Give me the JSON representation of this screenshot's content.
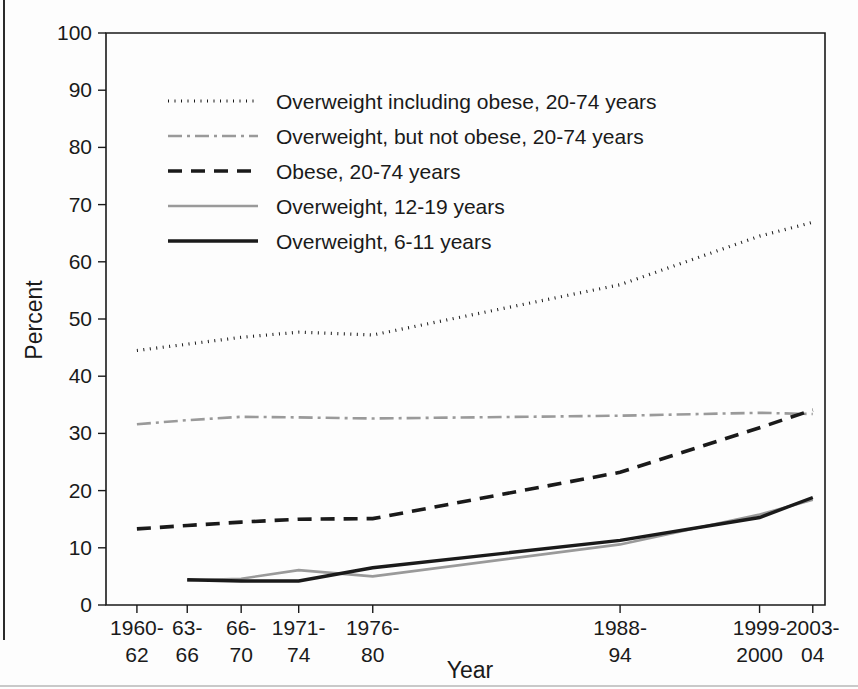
{
  "chart_data": {
    "type": "line",
    "title": "",
    "xlabel": "Year",
    "ylabel": "Percent",
    "ylim": [
      0,
      100
    ],
    "ytick_step": 10,
    "yticks": [
      0,
      10,
      20,
      30,
      40,
      50,
      60,
      70,
      80,
      90,
      100
    ],
    "grid": false,
    "legend_position": "upper-left-inside",
    "categories": [
      "1960-\n62",
      "63-\n66",
      "66-\n70",
      "1971-\n74",
      "1976-\n80",
      "1988-\n94",
      "1999-\n2000",
      "2003-\n04"
    ],
    "category_lines": [
      [
        "1960-",
        "62"
      ],
      [
        "63-",
        "66"
      ],
      [
        "66-",
        "70"
      ],
      [
        "1971-",
        "74"
      ],
      [
        "1976-",
        "80"
      ],
      [
        "1988-",
        "94"
      ],
      [
        "1999-",
        "2000"
      ],
      [
        "2003-",
        "04"
      ]
    ],
    "x_positions_fraction": [
      0.043,
      0.113,
      0.188,
      0.268,
      0.371,
      0.715,
      0.909,
      0.983
    ],
    "series": [
      {
        "name": "Overweight including obese, 20-74 years",
        "style": "dotted",
        "color": "#1a1a1a",
        "width": 3.2,
        "dash": "1,5.5",
        "start_index": 0,
        "values": [
          44.5,
          45.6,
          46.8,
          47.7,
          47.2,
          56.0,
          64.5,
          66.9
        ]
      },
      {
        "name": "Overweight, but not obese, 20-74 years",
        "style": "dash-dot",
        "color": "#9a9a9a",
        "width": 2.6,
        "dash": "14,5,3,5",
        "start_index": 0,
        "values": [
          31.6,
          32.3,
          32.9,
          32.8,
          32.6,
          33.1,
          33.6,
          33.4
        ]
      },
      {
        "name": "Obese, 20-74 years",
        "style": "dashed",
        "color": "#1a1a1a",
        "width": 3.6,
        "dash": "14,9",
        "start_index": 0,
        "values": [
          13.3,
          13.9,
          14.5,
          15.0,
          15.1,
          23.2,
          31.0,
          34.1
        ]
      },
      {
        "name": "Overweight, 12-19 years",
        "style": "solid",
        "color": "#9a9a9a",
        "width": 2.6,
        "dash": "",
        "start_index": 1,
        "values": [
          null,
          4.3,
          4.6,
          6.1,
          5.0,
          10.6,
          15.8,
          18.4
        ]
      },
      {
        "name": "Overweight, 6-11 years",
        "style": "solid",
        "color": "#1a1a1a",
        "width": 3.4,
        "dash": "",
        "start_index": 1,
        "values": [
          null,
          4.4,
          4.2,
          4.2,
          6.5,
          11.3,
          15.3,
          18.8
        ]
      }
    ]
  },
  "legend": {
    "items": [
      {
        "label": "Overweight including obese, 20-74 years",
        "swatch": "dotted-black"
      },
      {
        "label": "Overweight, but not obese, 20-74 years",
        "swatch": "dashdot-gray"
      },
      {
        "label": "Obese, 20-74 years",
        "swatch": "dashed-black"
      },
      {
        "label": "Overweight, 12-19 years",
        "swatch": "solid-gray"
      },
      {
        "label": "Overweight, 6-11 years",
        "swatch": "solid-black"
      }
    ]
  },
  "colors": {
    "axis": "#1a1a1a",
    "black_series": "#1a1a1a",
    "gray_series": "#9a9a9a",
    "background": "#fdfdfd"
  }
}
